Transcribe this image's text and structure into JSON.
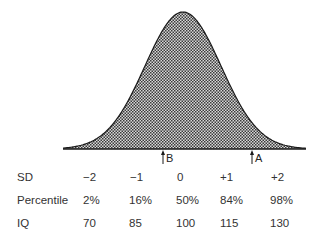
{
  "diagram": {
    "title": "",
    "type": "normal-distribution-curve",
    "fill_pattern": "crosshatch",
    "line_color": "#1a1a1a",
    "fill_color": "#555555",
    "curve": {
      "center_x": 183,
      "sigma_px": 38,
      "baseline_y": 149,
      "peak_y": 12,
      "x_start": 63,
      "x_end": 306
    },
    "markers": [
      {
        "label": "B",
        "x": 163
      },
      {
        "label": "A",
        "x": 252
      }
    ]
  },
  "table": {
    "rows": [
      {
        "label": "SD",
        "values": [
          "−2",
          "−1",
          "0",
          "+1",
          "+2"
        ]
      },
      {
        "label": "Percentile",
        "values": [
          "2%",
          "16%",
          "50%",
          "84%",
          "98%"
        ]
      },
      {
        "label": "IQ",
        "values": [
          "70",
          "85",
          "100",
          "115",
          "130"
        ]
      }
    ]
  },
  "chart_data": {
    "type": "area",
    "xlabel": "",
    "ylabel": "",
    "categories": [
      "−2 SD",
      "−1 SD",
      "0 SD",
      "+1 SD",
      "+2 SD"
    ],
    "series": [
      {
        "name": "SD",
        "values": [
          -2,
          -1,
          0,
          1,
          2
        ]
      },
      {
        "name": "Percentile",
        "values": [
          2,
          16,
          50,
          84,
          98
        ]
      },
      {
        "name": "IQ",
        "values": [
          70,
          85,
          100,
          115,
          130
        ]
      }
    ],
    "annotations": [
      {
        "label": "B",
        "position": "just below mean (approx. −0.5 SD)"
      },
      {
        "label": "A",
        "position": "approx. +1.5 SD"
      }
    ],
    "grid": false,
    "legend": "none"
  }
}
